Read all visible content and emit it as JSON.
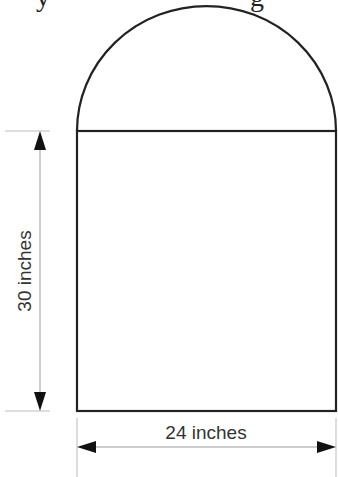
{
  "figure": {
    "type": "composite shape: rectangle with semicircle on top",
    "colors": {
      "stroke": "#222222",
      "dimension": "#999999",
      "arrow": "#111111",
      "text": "#333333"
    },
    "rectangle": {
      "width_label": "24 inches",
      "height_label": "30 inches"
    },
    "semicircle": {
      "diameter": "24 inches"
    },
    "dimensions": {
      "vertical": {
        "label": "30 inches"
      },
      "horizontal": {
        "label": "24 inches"
      }
    },
    "cropped_top_text": "y ... g"
  }
}
